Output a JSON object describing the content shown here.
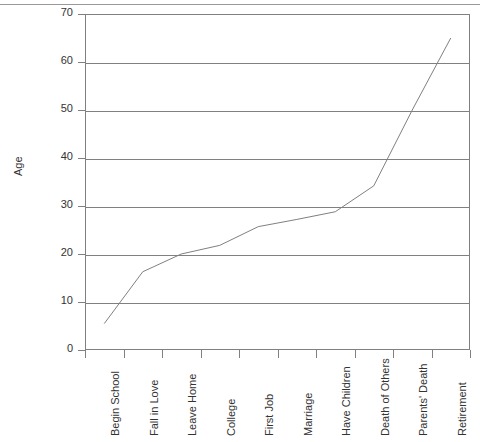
{
  "chart_data": {
    "type": "line",
    "title": "",
    "xlabel": "",
    "ylabel": "Age",
    "ylim": [
      0,
      70
    ],
    "ytick_step": 10,
    "yticks": [
      0,
      10,
      20,
      30,
      40,
      50,
      60,
      70
    ],
    "ytick_labels": [
      "0",
      "10",
      "20",
      "30",
      "40",
      "50",
      "60",
      "70"
    ],
    "grid": true,
    "legend": "none",
    "line_color": "#808080",
    "categories": [
      "Begin School",
      "Fall in Love",
      "Leave Home",
      "College",
      "First Job",
      "Marriage",
      "Have Children",
      "Death of Others",
      "Parents' Death",
      "Retirement"
    ],
    "values": [
      5.5,
      16.3,
      20,
      21.8,
      25.7,
      27.2,
      28.8,
      34.2,
      50,
      65
    ]
  },
  "axis": {
    "y_title": "Age"
  }
}
